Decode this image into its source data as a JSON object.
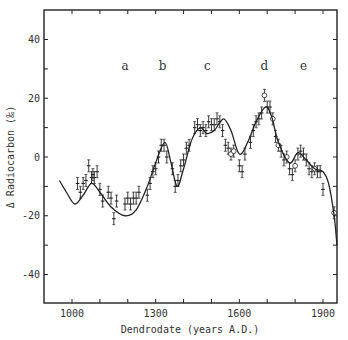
{
  "chart_data": {
    "type": "line",
    "title": "",
    "xlabel": "Dendrodate (years A.D.)",
    "ylabel": "Δ Radiocarbon (‰)",
    "xlim": [
      900,
      1950
    ],
    "ylim": [
      -50,
      50
    ],
    "x_ticks": [
      1000,
      1100,
      1200,
      1300,
      1400,
      1500,
      1600,
      1700,
      1800,
      1900
    ],
    "x_tick_labels": [
      "1000",
      "1300",
      "1600",
      "1900"
    ],
    "x_tick_label_values": [
      1000,
      1300,
      1600,
      1900
    ],
    "y_ticks": [
      -40,
      -30,
      -20,
      -10,
      0,
      10,
      20,
      30,
      40
    ],
    "y_tick_labels": [
      "-40",
      "-20",
      "0",
      "20",
      "40"
    ],
    "y_tick_label_values": [
      -40,
      -20,
      0,
      20,
      40
    ],
    "grid": false,
    "legend": null,
    "annotations": [
      {
        "text": "a",
        "x": 1190,
        "y": 31
      },
      {
        "text": "b",
        "x": 1325,
        "y": 31
      },
      {
        "text": "c",
        "x": 1485,
        "y": 31
      },
      {
        "text": "d",
        "x": 1690,
        "y": 31
      },
      {
        "text": "e",
        "x": 1830,
        "y": 31
      }
    ],
    "series": [
      {
        "name": "fitted curve",
        "style": "line",
        "x": [
          955,
          980,
          1010,
          1040,
          1070,
          1100,
          1140,
          1190,
          1230,
          1270,
          1300,
          1333,
          1355,
          1377,
          1400,
          1430,
          1460,
          1483,
          1510,
          1543,
          1570,
          1600,
          1630,
          1660,
          1693,
          1715,
          1740,
          1780,
          1810,
          1840,
          1870,
          1900,
          1920,
          1940,
          1950
        ],
        "y": [
          -8,
          -12,
          -16,
          -13,
          -9,
          -12,
          -17,
          -20,
          -18,
          -10,
          -2,
          5,
          -2,
          -10,
          -4,
          6,
          10,
          8,
          9,
          13,
          9,
          1,
          5,
          12,
          17,
          14,
          5,
          -2,
          1.5,
          -1,
          -4,
          -5,
          -9,
          -20,
          -30
        ]
      },
      {
        "name": "tree-ring measurements",
        "style": "points-with-error-bars",
        "x": [
          1020,
          1030,
          1040,
          1050,
          1060,
          1070,
          1075,
          1080,
          1090,
          1100,
          1110,
          1130,
          1140,
          1150,
          1160,
          1190,
          1200,
          1210,
          1220,
          1230,
          1240,
          1270,
          1280,
          1290,
          1300,
          1310,
          1320,
          1330,
          1340,
          1360,
          1370,
          1380,
          1390,
          1400,
          1410,
          1420,
          1440,
          1450,
          1460,
          1470,
          1480,
          1490,
          1500,
          1510,
          1520,
          1530,
          1540,
          1550,
          1560,
          1570,
          1580,
          1600,
          1610,
          1620,
          1640,
          1650,
          1660,
          1670,
          1680,
          1690,
          1700,
          1710,
          1720,
          1730,
          1740,
          1750,
          1760,
          1770,
          1780,
          1790,
          1800,
          1810,
          1820,
          1830,
          1840,
          1850,
          1860,
          1870,
          1880,
          1890,
          1900,
          1940
        ],
        "y": [
          -9,
          -12,
          -9,
          -8,
          -3,
          -7,
          -6,
          -7,
          -5,
          -11,
          -15,
          -12,
          -14,
          -21,
          -15,
          -16,
          -14,
          -16,
          -14,
          -14,
          -12,
          -13,
          -9,
          -5,
          -4,
          0,
          4,
          4,
          0,
          -4,
          -10,
          -8,
          -3,
          -1,
          3,
          4,
          10,
          11,
          9,
          10,
          9,
          12,
          11,
          11,
          13,
          12,
          9,
          4,
          3,
          1,
          2,
          -3,
          -5,
          1,
          5,
          9,
          12,
          13,
          15,
          21,
          17,
          17,
          13,
          7,
          4,
          2,
          -1,
          0,
          -4,
          -6,
          -3,
          1,
          2,
          1,
          -1,
          -4,
          -5,
          -4,
          -5,
          -5,
          -11,
          -19
        ],
        "open_circle_at": [
          1570,
          1580,
          1690,
          1720,
          1740,
          1770,
          1800,
          1870,
          1910,
          1940
        ]
      }
    ]
  }
}
